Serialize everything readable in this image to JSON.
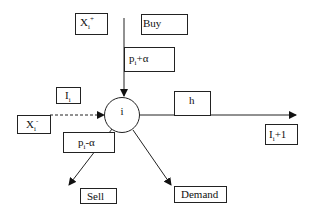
{
  "diagram": {
    "node": {
      "label": "i"
    },
    "boxes": {
      "x_plus": {
        "base": "X",
        "sub": "i",
        "sup": "+"
      },
      "buy": {
        "label": "Buy"
      },
      "p_plus": {
        "base": "p",
        "sub": "i",
        "rest": "+α"
      },
      "inv": {
        "base": "I",
        "sub": "i"
      },
      "x_minus": {
        "base": "X",
        "sub": "i",
        "sup": "-"
      },
      "p_minus": {
        "base": "p",
        "sub": "i",
        "rest": "-α"
      },
      "h": {
        "label": "h"
      },
      "inv_next": {
        "base": "I",
        "sub": "i",
        "rest": "+1"
      },
      "sell": {
        "label": "Sell"
      },
      "demand": {
        "label": "Demand"
      }
    },
    "edges": [
      {
        "from": "buy",
        "to": "i",
        "style": "solid"
      },
      {
        "from": "x_minus",
        "to": "i",
        "style": "dashed"
      },
      {
        "from": "i",
        "to": "inv_next",
        "style": "solid"
      },
      {
        "from": "i",
        "to": "sell",
        "style": "solid"
      },
      {
        "from": "i",
        "to": "demand",
        "style": "solid"
      }
    ]
  }
}
